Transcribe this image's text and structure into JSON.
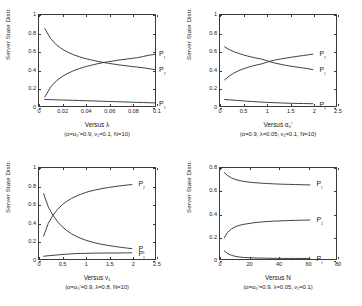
{
  "figure": {
    "ylabel": "Server State Distr.",
    "series_names": [
      "P0",
      "P1",
      "P2"
    ]
  },
  "chart_data": [
    {
      "type": "line",
      "panel": "top-left",
      "title": "",
      "xlabel": "Versus λ",
      "ylabel": "Server State Distr.",
      "caption": "(α=α₀'=0.9, ν₁=0.1, N=10)",
      "xlim": [
        0,
        0.1
      ],
      "ylim": [
        0,
        1
      ],
      "xticks": [
        "0",
        "0.02",
        "0.04",
        "0.06",
        "0.08",
        "0.1"
      ],
      "xtick_values": [
        0,
        0.02,
        0.04,
        0.06,
        0.08,
        0.1
      ],
      "yticks": [
        "0",
        "0.2",
        "0.4",
        "0.6",
        "0.8",
        "1"
      ],
      "ytick_values": [
        0,
        0.2,
        0.4,
        0.6,
        0.8,
        1
      ],
      "grid": false,
      "legend": "inline-end-labels",
      "x": [
        0.005,
        0.01,
        0.015,
        0.02,
        0.025,
        0.03,
        0.035,
        0.04,
        0.045,
        0.05,
        0.055,
        0.06,
        0.065,
        0.07,
        0.075,
        0.08,
        0.085,
        0.09,
        0.095,
        0.1
      ],
      "series": [
        {
          "name": "P2",
          "label": "P₂",
          "values": [
            0.85,
            0.74,
            0.672,
            0.625,
            0.59,
            0.562,
            0.54,
            0.521,
            0.506,
            0.492,
            0.48,
            0.469,
            0.459,
            0.45,
            0.442,
            0.434,
            0.427,
            0.42,
            0.41,
            0.4
          ]
        },
        {
          "name": "P1",
          "label": "P₁",
          "values": [
            0.098,
            0.208,
            0.277,
            0.324,
            0.36,
            0.389,
            0.412,
            0.432,
            0.448,
            0.463,
            0.476,
            0.487,
            0.497,
            0.507,
            0.515,
            0.523,
            0.531,
            0.545,
            0.558,
            0.568
          ]
        },
        {
          "name": "P0",
          "label": "P₀",
          "values": [
            0.072,
            0.07,
            0.068,
            0.066,
            0.064,
            0.062,
            0.06,
            0.058,
            0.056,
            0.054,
            0.052,
            0.05,
            0.048,
            0.046,
            0.044,
            0.042,
            0.04,
            0.038,
            0.036,
            0.034
          ]
        }
      ]
    },
    {
      "type": "line",
      "panel": "top-right",
      "title": "",
      "xlabel": "Versus α₀'",
      "ylabel": "Server State Distr.",
      "caption": "(α=0.9, λ=0.05, ν₁=0.1, N=10)",
      "xlim": [
        0,
        2.5
      ],
      "ylim": [
        0,
        1
      ],
      "xticks": [
        "0",
        "0.5",
        "1",
        "1.5",
        "2",
        "2.5"
      ],
      "xtick_values": [
        0,
        0.5,
        1,
        1.5,
        2,
        2.5
      ],
      "yticks": [
        "0",
        "0.2",
        "0.4",
        "0.6",
        "0.8",
        "1"
      ],
      "ytick_values": [
        0,
        0.2,
        0.4,
        0.6,
        0.8,
        1
      ],
      "grid": false,
      "legend": "inline-end-labels",
      "x": [
        0.1,
        0.2,
        0.3,
        0.4,
        0.5,
        0.6,
        0.7,
        0.8,
        0.9,
        1.0,
        1.1,
        1.2,
        1.3,
        1.4,
        1.5,
        1.6,
        1.7,
        1.8,
        1.9,
        2.0
      ],
      "series": [
        {
          "name": "P1",
          "label": "P₁",
          "values": [
            0.65,
            0.62,
            0.597,
            0.578,
            0.562,
            0.548,
            0.536,
            0.525,
            0.515,
            0.5,
            0.482,
            0.47,
            0.459,
            0.449,
            0.44,
            0.432,
            0.424,
            0.417,
            0.409,
            0.4
          ]
        },
        {
          "name": "P2",
          "label": "P₂",
          "values": [
            0.288,
            0.33,
            0.362,
            0.388,
            0.408,
            0.425,
            0.44,
            0.452,
            0.463,
            0.48,
            0.495,
            0.506,
            0.516,
            0.525,
            0.533,
            0.541,
            0.548,
            0.555,
            0.562,
            0.57
          ]
        },
        {
          "name": "P0",
          "label": "P₀",
          "values": [
            0.072,
            0.068,
            0.064,
            0.06,
            0.056,
            0.052,
            0.049,
            0.046,
            0.043,
            0.04,
            0.038,
            0.036,
            0.034,
            0.032,
            0.03,
            0.029,
            0.028,
            0.027,
            0.026,
            0.025
          ]
        }
      ]
    },
    {
      "type": "line",
      "panel": "bottom-left",
      "title": "",
      "xlabel": "Versus ν₁",
      "ylabel": "Server State Distr.",
      "caption": "(α=α₀'=0.9, λ=0.8, N=10)",
      "xlim": [
        0,
        2.5
      ],
      "ylim": [
        0,
        1
      ],
      "xticks": [
        "0",
        "0.5",
        "1",
        "1.5",
        "2",
        "2.5"
      ],
      "xtick_values": [
        0,
        0.5,
        1,
        1.5,
        2,
        2.5
      ],
      "yticks": [
        "0",
        "0.2",
        "0.4",
        "0.6",
        "0.8",
        "1"
      ],
      "ytick_values": [
        0,
        0.2,
        0.4,
        0.6,
        0.8,
        1
      ],
      "grid": false,
      "legend": "inline-end-labels",
      "x": [
        0.1,
        0.2,
        0.3,
        0.4,
        0.5,
        0.6,
        0.7,
        0.8,
        0.9,
        1.0,
        1.1,
        1.2,
        1.3,
        1.4,
        1.5,
        1.6,
        1.7,
        1.8,
        1.9,
        2.0
      ],
      "series": [
        {
          "name": "P2",
          "label": "P₂",
          "values": [
            0.252,
            0.392,
            0.478,
            0.545,
            0.595,
            0.635,
            0.665,
            0.69,
            0.712,
            0.73,
            0.745,
            0.757,
            0.768,
            0.778,
            0.786,
            0.794,
            0.801,
            0.807,
            0.813,
            0.818
          ]
        },
        {
          "name": "P1",
          "label": "P₁",
          "values": [
            0.718,
            0.572,
            0.482,
            0.41,
            0.355,
            0.312,
            0.278,
            0.25,
            0.227,
            0.208,
            0.192,
            0.178,
            0.167,
            0.157,
            0.148,
            0.14,
            0.133,
            0.126,
            0.12,
            0.114
          ]
        },
        {
          "name": "P0",
          "label": "P₀",
          "values": [
            0.03,
            0.036,
            0.04,
            0.045,
            0.05,
            0.053,
            0.057,
            0.06,
            0.061,
            0.062,
            0.063,
            0.065,
            0.065,
            0.065,
            0.066,
            0.066,
            0.066,
            0.067,
            0.067,
            0.068
          ]
        }
      ]
    },
    {
      "type": "line",
      "panel": "bottom-right",
      "title": "",
      "xlabel": "Versus N",
      "ylabel": "Server State Distr.",
      "caption": "(α=α₀'=0.9, λ=0.05, ν₁=0.1)",
      "xlim": [
        0,
        80
      ],
      "ylim": [
        0,
        0.8
      ],
      "xticks": [
        "0",
        "20",
        "40",
        "60",
        "80"
      ],
      "xtick_values": [
        0,
        20,
        40,
        60,
        80
      ],
      "yticks": [
        "0",
        "0.2",
        "0.4",
        "0.6",
        "0.8"
      ],
      "ytick_values": [
        0,
        0.2,
        0.4,
        0.6,
        0.8
      ],
      "grid": false,
      "legend": "inline-end-labels",
      "x": [
        3,
        5,
        8,
        11,
        14,
        17,
        20,
        24,
        28,
        32,
        36,
        40,
        44,
        48,
        52,
        56,
        60,
        62
      ],
      "series": [
        {
          "name": "P1",
          "label": "P₁",
          "values": [
            0.76,
            0.736,
            0.712,
            0.697,
            0.688,
            0.681,
            0.676,
            0.671,
            0.667,
            0.664,
            0.661,
            0.659,
            0.657,
            0.656,
            0.654,
            0.653,
            0.652,
            0.651
          ]
        },
        {
          "name": "P2",
          "label": "P₂",
          "values": [
            0.186,
            0.232,
            0.266,
            0.286,
            0.298,
            0.306,
            0.312,
            0.32,
            0.325,
            0.329,
            0.332,
            0.334,
            0.336,
            0.338,
            0.34,
            0.341,
            0.342,
            0.343
          ]
        },
        {
          "name": "P0",
          "label": "P₀",
          "values": [
            0.072,
            0.05,
            0.032,
            0.022,
            0.016,
            0.013,
            0.011,
            0.009,
            0.008,
            0.007,
            0.006,
            0.006,
            0.005,
            0.005,
            0.005,
            0.005,
            0.005,
            0.005
          ]
        }
      ]
    }
  ]
}
